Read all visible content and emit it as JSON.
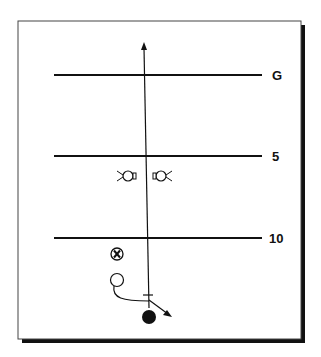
{
  "diagram": {
    "type": "football-play",
    "yard_lines": [
      {
        "label": "G",
        "y": 75
      },
      {
        "label": "5",
        "y": 156
      },
      {
        "label": "10",
        "y": 238
      }
    ],
    "players": [
      {
        "role": "defender-left",
        "symbol": "cross-circle-ear",
        "x": 128,
        "y": 176
      },
      {
        "role": "defender-right",
        "symbol": "cross-circle-ear",
        "x": 163,
        "y": 176
      },
      {
        "role": "defender-x",
        "symbol": "circled-X",
        "x": 117,
        "y": 254
      },
      {
        "role": "running-back",
        "symbol": "open-circle",
        "x": 118,
        "y": 280
      },
      {
        "role": "quarterback",
        "symbol": "filled-circle",
        "x": 149,
        "y": 316
      }
    ],
    "routes": [
      {
        "from": "quarterback",
        "description": "vertical arrow upfield"
      },
      {
        "from": "quarterback",
        "description": "short diagonal arrow to right"
      },
      {
        "from": "running-back",
        "description": "curved motion to quarterback"
      }
    ],
    "colors": {
      "line": "#111111",
      "background": "#ffffff"
    }
  }
}
